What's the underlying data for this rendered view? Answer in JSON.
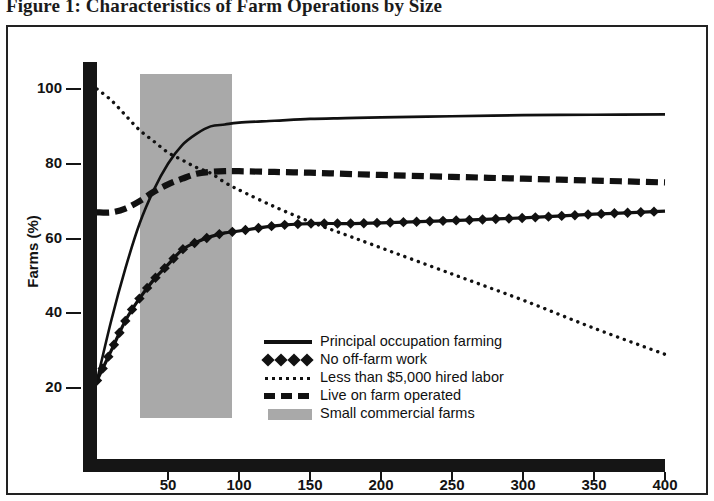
{
  "figure": {
    "title": "Figure 1: Characteristics of Farm Operations by Size"
  },
  "chart_data": {
    "type": "line",
    "title": "Figure 1: Characteristics of Farm Operations by Size",
    "xlabel": "",
    "ylabel": "Farms (%)",
    "xlim": [
      0,
      410
    ],
    "ylim": [
      12,
      106
    ],
    "grid": false,
    "legend_position": "inside-lower-right",
    "x_ticks": [
      50,
      100,
      150,
      200,
      250,
      300,
      350,
      400
    ],
    "y_ticks": [
      20,
      40,
      60,
      80,
      100
    ],
    "x": [
      0,
      10,
      20,
      30,
      40,
      50,
      60,
      70,
      80,
      90,
      100,
      125,
      150,
      175,
      200,
      250,
      300,
      350,
      400
    ],
    "series": [
      {
        "name": "Principal occupation farming",
        "style": "solid",
        "values": [
          22,
          38,
          52,
          64,
          73,
          80,
          85,
          88,
          90,
          90.5,
          91,
          91.5,
          92,
          92.2,
          92.4,
          92.7,
          93,
          93.1,
          93.2
        ]
      },
      {
        "name": "No off-farm work",
        "style": "diamond",
        "values": [
          22,
          30,
          38,
          44,
          49,
          53,
          57,
          59,
          60.5,
          61.5,
          62,
          63.4,
          64,
          64,
          64.2,
          64.8,
          65.5,
          66.5,
          67.3
        ]
      },
      {
        "name": "Less than $5,000 hired labor",
        "style": "dotted",
        "values": [
          100,
          97,
          93,
          89,
          86,
          83,
          81,
          79,
          77.5,
          75,
          73,
          68.5,
          64.5,
          61,
          57.5,
          50.5,
          43.5,
          36,
          29
        ]
      },
      {
        "name": "Live on farm operated",
        "style": "dashed",
        "values": [
          67,
          67,
          68,
          70,
          72.5,
          74.5,
          76,
          77.3,
          77.8,
          78,
          78,
          77.8,
          77.6,
          77.3,
          77,
          76.5,
          76,
          75.5,
          75
        ]
      }
    ],
    "shaded_region": {
      "name": "Small commercial farms",
      "x_start": 30,
      "x_end": 95,
      "y_start": 12,
      "y_end": 104,
      "color": "#a9a9a9"
    }
  },
  "legend": {
    "items": [
      {
        "label": "Principal occupation farming",
        "marker": "solid-line-marker"
      },
      {
        "label": "No off-farm work",
        "marker": "diamond-line-marker"
      },
      {
        "label": "Less than $5,000 hired labor",
        "marker": "dotted-line-marker"
      },
      {
        "label": "Live on farm operated",
        "marker": "dashed-line-marker"
      },
      {
        "label": "Small commercial farms",
        "marker": "gray-swatch-marker"
      }
    ]
  },
  "axes": {
    "y_label": "Farms (%)",
    "y_ticks": [
      "100",
      "80",
      "60",
      "40",
      "20"
    ],
    "x_ticks": [
      "50",
      "100",
      "150",
      "200",
      "250",
      "300",
      "350",
      "400"
    ]
  }
}
